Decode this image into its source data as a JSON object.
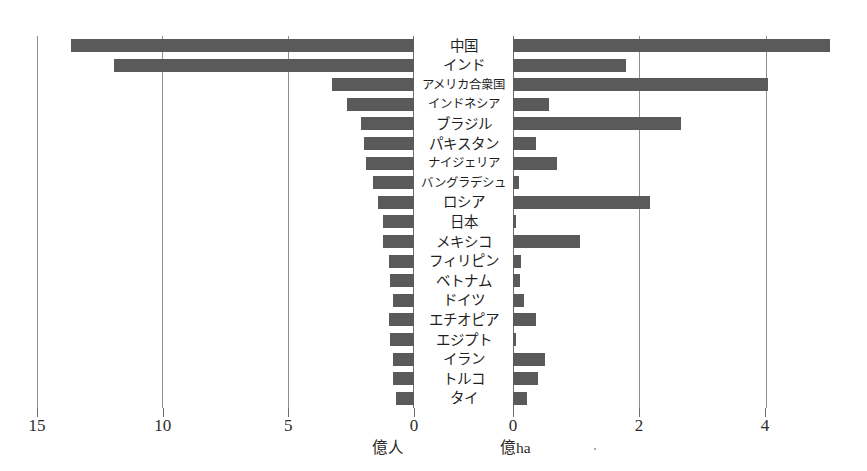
{
  "chart_data": {
    "type": "bar",
    "orientation": "horizontal",
    "subtype": "back-to-back paired horizontal bar chart (population pyramid style)",
    "title": "",
    "categories": [
      "中国",
      "インド",
      "アメリカ合衆国",
      "インドネシア",
      "ブラジル",
      "パキスタン",
      "ナイジェリア",
      "バングラデシュ",
      "ロシア",
      "日本",
      "メキシコ",
      "フィリピン",
      "ベトナム",
      "ドイツ",
      "エチオピア",
      "エジプト",
      "イラン",
      "トルコ",
      "タイ"
    ],
    "series": [
      {
        "name": "人口",
        "unit": "億人",
        "side": "left",
        "axis_direction": "right-to-left",
        "axis_ticks": [
          15,
          10,
          5,
          0
        ],
        "axis_min": 0,
        "axis_max": 15,
        "values": [
          13.65,
          11.95,
          3.25,
          2.65,
          2.1,
          2.0,
          1.9,
          1.65,
          1.45,
          1.25,
          1.25,
          1.0,
          0.95,
          0.83,
          1.0,
          0.95,
          0.82,
          0.82,
          0.7
        ]
      },
      {
        "name": "農地面積",
        "unit": "億ha",
        "side": "right",
        "axis_direction": "left-to-right",
        "axis_ticks": [
          0,
          2,
          4
        ],
        "axis_min": 0,
        "axis_max": 5,
        "values": [
          5.03,
          1.8,
          4.05,
          0.57,
          2.67,
          0.37,
          0.7,
          0.09,
          2.17,
          0.05,
          1.06,
          0.12,
          0.11,
          0.17,
          0.36,
          0.04,
          0.5,
          0.39,
          0.22
        ]
      }
    ],
    "left_axis_label": "億人",
    "right_axis_label": "億ha",
    "xlabel": "",
    "ylabel": "",
    "grid": true,
    "legend": "none",
    "bar_color": "#5a5a5a",
    "grid_color": "#8e8e8e",
    "background": "#ffffff"
  },
  "axes": {
    "left": {
      "unit_label": "億人",
      "ticks": [
        {
          "value": 15,
          "label": "15"
        },
        {
          "value": 10,
          "label": "10"
        },
        {
          "value": 5,
          "label": "5"
        },
        {
          "value": 0,
          "label": "0"
        }
      ]
    },
    "right": {
      "unit_label": "億ha",
      "ticks": [
        {
          "value": 0,
          "label": "0"
        },
        {
          "value": 2,
          "label": "2"
        },
        {
          "value": 4,
          "label": "4"
        }
      ]
    }
  }
}
